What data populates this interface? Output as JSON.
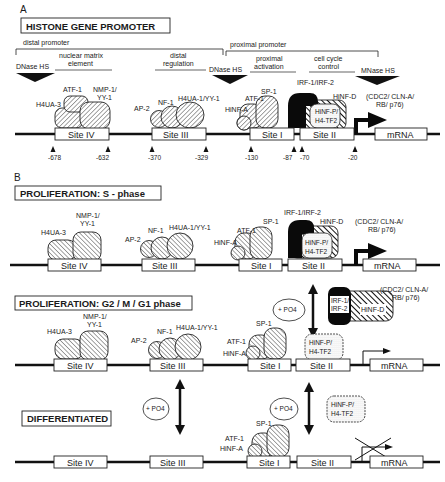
{
  "panel_a": {
    "letter": "A",
    "title": "HISTONE GENE PROMOTER",
    "regions": {
      "distal_promoter": "distal promoter",
      "proximal_promoter": "proximal promoter",
      "nuclear_matrix_1": "nuclear matrix",
      "nuclear_matrix_2": "element",
      "distal_reg_1": "distal",
      "distal_reg_2": "regulation",
      "proximal_act_1": "proximal",
      "proximal_act_2": "activation",
      "cell_cycle_1": "cell cycle",
      "cell_cycle_2": "control"
    },
    "hypersensitive_sites": [
      "DNase HS",
      "DNase HS",
      "MNase HS"
    ],
    "factors": {
      "h4ua3": "H4UA-3",
      "atf1_iv": "ATF-1",
      "nmp1_a": "NMP-1/",
      "nmp1_b": "YY-1",
      "ap2": "AP-2",
      "nf1": "NF-1",
      "h4ua1": "H4UA-1/YY-1",
      "hinfa": "HiNF-A",
      "atf1": "ATF-1",
      "sp1": "SP-1",
      "irf": "IRF-1/IRF-2",
      "hinfd": "HiNF-D",
      "hinfp_a": "HiNF-P/",
      "hinfp_b": "H4-TF2",
      "cdc2_a": "(CDC2/ CLN-A/",
      "cdc2_b": "RB/ p76)"
    },
    "sites": [
      "Site IV",
      "Site III",
      "Site I",
      "Site II"
    ],
    "mrna": "mRNA",
    "positions": [
      "-678",
      "-632",
      "-370",
      "-329",
      "-130",
      "-87",
      "-70",
      "-20"
    ]
  },
  "panel_b": {
    "letter": "B",
    "states": [
      {
        "title": "PROLIFERATION:  S - phase",
        "factors": [
          "H4UA-3",
          "NMP-1/",
          "YY-1",
          "AP-2",
          "NF-1",
          "H4UA-1/YY-1",
          "HiNF-A",
          "ATF-1",
          "SP-1",
          "IRF-1/IRF-2",
          "HiNF-D",
          "(CDC2/ CLN-A/",
          "RB/ p76)",
          "HiNF-P/",
          "H4-TF2"
        ],
        "transcription": "active"
      },
      {
        "title": "PROLIFERATION: G2 / M / G1 phase",
        "factors": [
          "H4UA-3",
          "NMP-1/",
          "YY-1",
          "AP-2",
          "NF-1",
          "H4UA-1/YY-1",
          "HiNF-A",
          "ATF-1",
          "SP-1",
          "IRF-1/",
          "IRF-2",
          "HiNF-D",
          "(CDC2/ CLN-A/",
          "RB/ p76)",
          "HiNF-P/",
          "H4-TF2"
        ],
        "po4": "+ PO4",
        "transcription": "reduced"
      },
      {
        "title": "DIFFERENTIATED",
        "factors": [
          "HiNF-A",
          "ATF-1",
          "SP-1",
          "HiNF-P/",
          "H4-TF2"
        ],
        "po4": "+ PO4",
        "transcription": "blocked"
      }
    ],
    "sites": [
      "Site IV",
      "Site III",
      "Site I",
      "Site II"
    ],
    "mrna": "mRNA"
  }
}
